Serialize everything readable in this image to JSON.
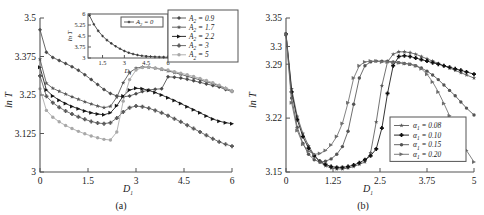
{
  "figure": {
    "background": "#ffffff",
    "panels": [
      "a",
      "b"
    ]
  },
  "panel_a": {
    "caption": "(a)",
    "xlabel": "D",
    "xlabel_sub": "1",
    "ylabel": "ln T",
    "xticks": [
      "0",
      "1.5",
      "3",
      "4.5",
      "6"
    ],
    "yticks": [
      "3",
      "3.125",
      "3.25",
      "3.375",
      "3.5"
    ],
    "legend": [
      {
        "label": "A",
        "sub": "2",
        "eq": "= 0.9",
        "color": "#4a4a4a",
        "marker": "diamond"
      },
      {
        "label": "A",
        "sub": "2",
        "eq": "= 1.7",
        "color": "#555555",
        "marker": "star"
      },
      {
        "label": "A",
        "sub": "2",
        "eq": "= 2.2",
        "color": "#151515",
        "marker": "triangle"
      },
      {
        "label": "A",
        "sub": "2",
        "eq": "= 3",
        "color": "#5a5a5a",
        "marker": "plus"
      },
      {
        "label": "A",
        "sub": "2",
        "eq": "= 5",
        "color": "#a8a8a8",
        "marker": "circle"
      }
    ],
    "inset": {
      "xlabel": "D",
      "xlabel_sub": "1",
      "ylabel": "ln T",
      "xticks": [
        "1.5",
        "3",
        "4.5",
        "6"
      ],
      "yticks": [
        "3",
        "3.75",
        "4.5",
        "5.25",
        "6"
      ],
      "legend_label": "A",
      "legend_sub": "2",
      "legend_eq": "= 0",
      "color": "#3a3a3a"
    }
  },
  "panel_b": {
    "caption": "(b)",
    "xlabel": "D",
    "xlabel_sub": "1",
    "ylabel": "ln T",
    "xticks": [
      "0",
      "1.25",
      "2.5",
      "3.75",
      "5"
    ],
    "yticks": [
      "3.15",
      "3.22",
      "3.29",
      "3.3",
      "3.35"
    ],
    "legend": [
      {
        "label": "α",
        "sub": "1",
        "eq": "= 0.08",
        "color": "#5a5a5a",
        "marker": "star"
      },
      {
        "label": "α",
        "sub": "1",
        "eq": "= 0.10",
        "color": "#101010",
        "marker": "plus"
      },
      {
        "label": "α",
        "sub": "1",
        "eq": "= 0.15",
        "color": "#545454",
        "marker": "circle"
      },
      {
        "label": "α",
        "sub": "1",
        "eq": "= 0.20",
        "color": "#6d6d6d",
        "marker": "triangle"
      }
    ]
  },
  "chart_data": [
    {
      "type": "line",
      "panel": "a",
      "title": "",
      "xlabel": "D1",
      "ylabel": "ln T",
      "xlim": [
        0,
        6
      ],
      "ylim": [
        3,
        3.5
      ],
      "grid": false,
      "legend_position": "top-right",
      "series": [
        {
          "name": "A2 = 0.9",
          "x": [
            0,
            0.2,
            0.4,
            0.6,
            0.8,
            1.0,
            1.2,
            1.4,
            1.6,
            1.8,
            2.0,
            2.2,
            2.4,
            2.6,
            2.8,
            3.0,
            3.2,
            3.4,
            3.6,
            3.8,
            4.0,
            4.2,
            4.4,
            4.6,
            4.8,
            5.0,
            5.2,
            5.4,
            5.6,
            5.8,
            6.0
          ],
          "y": [
            3.462,
            3.389,
            3.372,
            3.362,
            3.352,
            3.342,
            3.33,
            3.316,
            3.3,
            3.284,
            3.268,
            3.255,
            3.247,
            3.244,
            3.247,
            3.254,
            3.261,
            3.266,
            3.269,
            3.27,
            3.309,
            3.308,
            3.305,
            3.301,
            3.296,
            3.291,
            3.286,
            3.281,
            3.276,
            3.268,
            3.261
          ]
        },
        {
          "name": "A2 = 1.7",
          "x": [
            0,
            0.2,
            0.4,
            0.6,
            0.8,
            1.0,
            1.2,
            1.4,
            1.6,
            1.8,
            2.0,
            2.2,
            2.4,
            2.6,
            2.8,
            3.0,
            3.2,
            3.4,
            3.6,
            3.8,
            4.0,
            4.2,
            4.4,
            4.6,
            4.8,
            5.0,
            5.2,
            5.4,
            5.6,
            5.8,
            6.0
          ],
          "y": [
            3.366,
            3.288,
            3.272,
            3.262,
            3.253,
            3.244,
            3.236,
            3.228,
            3.221,
            3.214,
            3.209,
            3.213,
            3.243,
            3.29,
            3.323,
            3.337,
            3.341,
            3.34,
            3.337,
            3.333,
            3.328,
            3.323,
            3.317,
            3.311,
            3.305,
            3.299,
            3.293,
            3.287,
            3.28,
            3.272,
            3.264
          ]
        },
        {
          "name": "A2 = 2.2",
          "x": [
            0,
            0.2,
            0.4,
            0.6,
            0.8,
            1.0,
            1.2,
            1.4,
            1.6,
            1.8,
            2.0,
            2.2,
            2.4,
            2.6,
            2.8,
            3.0,
            3.2,
            3.4,
            3.6,
            3.8,
            4.0,
            4.2,
            4.4,
            4.6,
            4.8,
            5.0,
            5.2,
            5.4,
            5.6,
            5.8,
            6.0
          ],
          "y": [
            3.34,
            3.266,
            3.247,
            3.233,
            3.222,
            3.213,
            3.205,
            3.198,
            3.192,
            3.188,
            3.186,
            3.192,
            3.215,
            3.247,
            3.266,
            3.272,
            3.27,
            3.265,
            3.258,
            3.25,
            3.241,
            3.232,
            3.222,
            3.212,
            3.202,
            3.192,
            3.182,
            3.172,
            3.165,
            3.16,
            3.157
          ]
        },
        {
          "name": "A2 = 3",
          "x": [
            0,
            0.2,
            0.4,
            0.6,
            0.8,
            1.0,
            1.2,
            1.4,
            1.6,
            1.8,
            2.0,
            2.2,
            2.4,
            2.6,
            2.8,
            3.0,
            3.2,
            3.4,
            3.6,
            3.8,
            4.0,
            4.2,
            4.4,
            4.6,
            4.8,
            5.0,
            5.2,
            5.4,
            5.6,
            5.8,
            6.0
          ],
          "y": [
            3.312,
            3.246,
            3.225,
            3.21,
            3.198,
            3.188,
            3.179,
            3.171,
            3.164,
            3.159,
            3.157,
            3.16,
            3.175,
            3.195,
            3.209,
            3.214,
            3.212,
            3.207,
            3.2,
            3.192,
            3.183,
            3.173,
            3.163,
            3.152,
            3.141,
            3.13,
            3.119,
            3.108,
            3.098,
            3.09,
            3.084
          ]
        },
        {
          "name": "A2 = 5",
          "x": [
            0,
            0.2,
            0.4,
            0.6,
            0.8,
            1.0,
            1.2,
            1.4,
            1.6,
            1.8,
            2.0,
            2.2,
            2.4,
            2.6,
            2.8,
            3.0,
            3.2,
            3.4,
            3.6,
            3.8,
            4.0,
            4.2,
            4.4,
            4.6,
            4.8,
            5.0,
            5.2,
            5.4,
            5.6,
            5.8,
            6.0
          ],
          "y": [
            3.27,
            3.2,
            3.178,
            3.163,
            3.151,
            3.141,
            3.132,
            3.124,
            3.117,
            3.111,
            3.106,
            3.104,
            3.13,
            3.23,
            3.3,
            3.331,
            3.339,
            3.34,
            3.338,
            3.335,
            3.331,
            3.326,
            3.321,
            3.316,
            3.31,
            3.304,
            3.297,
            3.29,
            3.282,
            3.272,
            3.262
          ]
        }
      ]
    },
    {
      "type": "line",
      "panel": "a-inset",
      "title": "",
      "xlabel": "D1",
      "ylabel": "ln T",
      "xlim": [
        0.5,
        6
      ],
      "ylim": [
        3,
        6
      ],
      "grid": false,
      "legend_position": "top-right",
      "series": [
        {
          "name": "A2 = 0",
          "x": [
            0.6,
            0.9,
            1.2,
            1.5,
            1.8,
            2.1,
            2.4,
            2.7,
            3.0,
            3.3,
            3.6,
            3.9,
            4.2,
            4.5,
            4.8,
            5.1,
            5.4,
            5.7,
            6.0
          ],
          "y": [
            5.9,
            5.3,
            4.85,
            4.5,
            4.22,
            4.0,
            3.8,
            3.63,
            3.48,
            3.36,
            3.27,
            3.2,
            3.15,
            3.12,
            3.1,
            3.08,
            3.07,
            3.06,
            3.05
          ]
        }
      ]
    },
    {
      "type": "line",
      "panel": "b",
      "title": "",
      "xlabel": "D1",
      "ylabel": "ln T",
      "xlim": [
        0,
        5
      ],
      "ylim": [
        3.15,
        3.35
      ],
      "grid": false,
      "legend_position": "bottom-right",
      "series": [
        {
          "name": "alpha1 = 0.08",
          "x": [
            0,
            0.15,
            0.3,
            0.45,
            0.6,
            0.75,
            0.9,
            1.05,
            1.2,
            1.35,
            1.5,
            1.65,
            1.8,
            1.95,
            2.1,
            2.25,
            2.4,
            2.55,
            2.7,
            2.85,
            3.0,
            3.15,
            3.3,
            3.45,
            3.6,
            3.75,
            3.9,
            4.05,
            4.2,
            4.35,
            4.5,
            4.65,
            4.8,
            5.0
          ],
          "y": [
            3.329,
            3.258,
            3.222,
            3.2,
            3.184,
            3.172,
            3.163,
            3.158,
            3.155,
            3.154,
            3.154,
            3.155,
            3.157,
            3.16,
            3.163,
            3.175,
            3.215,
            3.262,
            3.293,
            3.303,
            3.306,
            3.306,
            3.305,
            3.303,
            3.3,
            3.297,
            3.294,
            3.291,
            3.288,
            3.285,
            3.282,
            3.279,
            3.276,
            3.272
          ]
        },
        {
          "name": "alpha1 = 0.10",
          "x": [
            0,
            0.15,
            0.3,
            0.45,
            0.6,
            0.75,
            0.9,
            1.05,
            1.2,
            1.35,
            1.5,
            1.65,
            1.8,
            1.95,
            2.1,
            2.25,
            2.4,
            2.55,
            2.7,
            2.85,
            3.0,
            3.15,
            3.3,
            3.45,
            3.6,
            3.75,
            3.9,
            4.05,
            4.2,
            4.35,
            4.5,
            4.65,
            4.8,
            5.0
          ],
          "y": [
            3.329,
            3.254,
            3.218,
            3.196,
            3.181,
            3.171,
            3.164,
            3.16,
            3.157,
            3.156,
            3.156,
            3.157,
            3.159,
            3.162,
            3.166,
            3.171,
            3.18,
            3.207,
            3.252,
            3.288,
            3.3,
            3.301,
            3.3,
            3.298,
            3.296,
            3.294,
            3.292,
            3.29,
            3.288,
            3.286,
            3.284,
            3.282,
            3.28,
            3.277
          ]
        },
        {
          "name": "alpha1 = 0.15",
          "x": [
            0,
            0.15,
            0.3,
            0.45,
            0.6,
            0.75,
            0.9,
            1.05,
            1.2,
            1.35,
            1.5,
            1.65,
            1.8,
            1.95,
            2.1,
            2.25,
            2.4,
            2.55,
            2.7,
            2.85,
            3.0,
            3.15,
            3.3,
            3.45,
            3.6,
            3.75,
            3.9,
            4.05,
            4.2,
            4.35,
            4.5,
            4.65,
            4.8,
            5.0
          ],
          "y": [
            3.329,
            3.246,
            3.208,
            3.187,
            3.173,
            3.166,
            3.163,
            3.164,
            3.167,
            3.173,
            3.183,
            3.203,
            3.238,
            3.272,
            3.288,
            3.293,
            3.294,
            3.294,
            3.294,
            3.293,
            3.292,
            3.291,
            3.29,
            3.288,
            3.285,
            3.281,
            3.276,
            3.27,
            3.263,
            3.256,
            3.249,
            3.241,
            3.233,
            3.224
          ]
        },
        {
          "name": "alpha1 = 0.20",
          "x": [
            0,
            0.15,
            0.3,
            0.45,
            0.6,
            0.75,
            0.9,
            1.05,
            1.2,
            1.35,
            1.5,
            1.65,
            1.8,
            1.95,
            2.1,
            2.25,
            2.4,
            2.55,
            2.7,
            2.85,
            3.0,
            3.15,
            3.3,
            3.45,
            3.6,
            3.75,
            3.9,
            4.05,
            4.2,
            4.35,
            4.5,
            4.65,
            4.8,
            5.0
          ],
          "y": [
            3.329,
            3.24,
            3.204,
            3.186,
            3.177,
            3.173,
            3.174,
            3.178,
            3.185,
            3.196,
            3.213,
            3.24,
            3.272,
            3.288,
            3.293,
            3.294,
            3.294,
            3.293,
            3.293,
            3.292,
            3.292,
            3.291,
            3.29,
            3.288,
            3.284,
            3.277,
            3.267,
            3.254,
            3.239,
            3.223,
            3.207,
            3.192,
            3.178,
            3.163
          ]
        }
      ]
    }
  ]
}
